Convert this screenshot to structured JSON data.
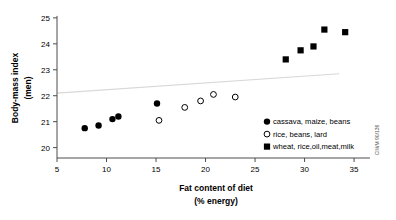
{
  "chart_data": {
    "type": "scatter",
    "title": "",
    "xlabel": "Fat content of diet",
    "xlabel_sub": "(% energy)",
    "ylabel": "Body-mass index",
    "ylabel_sub": "(men)",
    "xlim": [
      5,
      35.8
    ],
    "ylim": [
      19.6,
      25.15
    ],
    "xticks": [
      5,
      10,
      15,
      20,
      25,
      30,
      35
    ],
    "yticks": [
      20,
      21,
      22,
      23,
      24,
      25
    ],
    "xtick_labels": [
      "5",
      "10",
      "15",
      "20",
      "25",
      "30",
      "35"
    ],
    "ytick_labels": [
      "20",
      "21",
      "22",
      "23",
      "24",
      "25"
    ],
    "grid": false,
    "legend_position": "lower right",
    "series": [
      {
        "name": "cassava, maize, beans",
        "marker": "filled-circle",
        "color": "#000000",
        "points": [
          {
            "x": 7.8,
            "y": 20.75
          },
          {
            "x": 9.2,
            "y": 20.85
          },
          {
            "x": 10.6,
            "y": 21.1
          },
          {
            "x": 11.2,
            "y": 21.2
          },
          {
            "x": 15.1,
            "y": 21.7
          }
        ]
      },
      {
        "name": "rice, beans, lard",
        "marker": "open-circle",
        "color": "#000000",
        "points": [
          {
            "x": 15.3,
            "y": 21.05
          },
          {
            "x": 17.9,
            "y": 21.55
          },
          {
            "x": 19.5,
            "y": 21.8
          },
          {
            "x": 20.8,
            "y": 22.05
          },
          {
            "x": 23.0,
            "y": 21.95
          }
        ]
      },
      {
        "name": "wheat, rice,oil,meat,milk",
        "marker": "filled-square",
        "color": "#000000",
        "points": [
          {
            "x": 28.1,
            "y": 23.4
          },
          {
            "x": 29.6,
            "y": 23.75
          },
          {
            "x": 30.9,
            "y": 23.9
          },
          {
            "x": 32.0,
            "y": 24.55
          },
          {
            "x": 34.1,
            "y": 24.45
          }
        ]
      }
    ],
    "trendline": {
      "name": "regression-line",
      "color": "#d8d8d8",
      "start": {
        "x": 5.0,
        "y": 22.1
      },
      "end": {
        "x": 33.5,
        "y": 22.85
      }
    },
    "annotations": {
      "credit": "CIWM 90/136"
    }
  },
  "legend": {
    "entries": [
      {
        "label": "cassava, maize, beans",
        "marker": "filled-circle"
      },
      {
        "label": "rice, beans, lard",
        "marker": "open-circle"
      },
      {
        "label": "wheat, rice,oil,meat,milk",
        "marker": "filled-square"
      }
    ]
  }
}
